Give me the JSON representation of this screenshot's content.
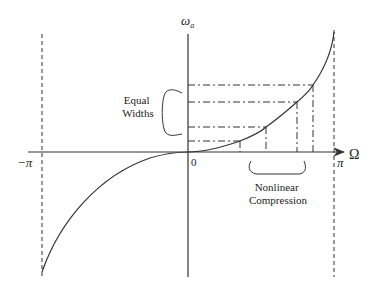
{
  "diagram": {
    "y_axis_label": "ω",
    "y_axis_subscript": "a",
    "x_axis_label": "Ω",
    "origin_label": "0",
    "neg_pi_label": "−π",
    "pos_pi_label": "π",
    "equal_widths_line1": "Equal",
    "equal_widths_line2": "Widths",
    "nonlinear_line1": "Nonlinear",
    "nonlinear_line2": "Compression",
    "line_color": "#333333"
  }
}
